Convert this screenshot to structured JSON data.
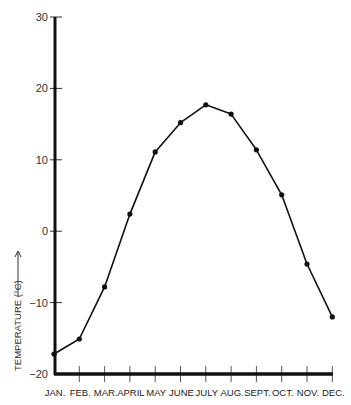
{
  "chart_data": {
    "type": "line",
    "title": "",
    "xlabel": "",
    "ylabel": "TEMPERATURE (°C)",
    "ylabel_arrow": "up",
    "categories": [
      "JAN.",
      "FEB.",
      "MAR.",
      "APRIL",
      "MAY",
      "JUNE",
      "JULY",
      "AUG.",
      "SEPT.",
      "OCT.",
      "NOV.",
      "DEC."
    ],
    "series": [
      {
        "name": "Temperature",
        "values": [
          -17.2,
          -15.1,
          -7.8,
          2.4,
          11.1,
          15.2,
          17.7,
          16.4,
          11.4,
          5.1,
          -4.6,
          -12.0
        ],
        "color": "#111111",
        "markers": true
      }
    ],
    "ylim": [
      -20,
      30
    ],
    "yticks": [
      -20,
      -10,
      0,
      10,
      20,
      30
    ],
    "ytick_labels": [
      "−20",
      "−10",
      "0",
      "10",
      "20",
      "30"
    ],
    "grid": false,
    "legend": null
  }
}
